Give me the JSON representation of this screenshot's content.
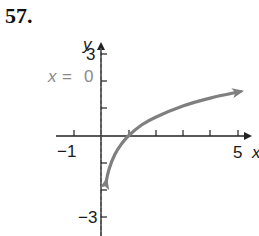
{
  "problem": {
    "number": "57."
  },
  "asymptote_label": {
    "var": "x",
    "eq": "=",
    "value": "0"
  },
  "axes": {
    "x_label": "x",
    "y_label": "y",
    "x_tick_labels": {
      "neg1": "−1",
      "five": "5"
    },
    "y_tick_labels": {
      "three": "3",
      "neg3": "−3"
    }
  },
  "colors": {
    "curve": "#7f7f7f",
    "axis": "#222222",
    "asymptote": "#555555",
    "label_gray": "#8a8a8a"
  },
  "chart_data": {
    "type": "line",
    "title": "",
    "xlabel": "x",
    "ylabel": "y",
    "xlim": [
      -1.2,
      5.3
    ],
    "ylim": [
      -3.3,
      3.5
    ],
    "x_ticks": [
      -1,
      0,
      1,
      2,
      3,
      4,
      5
    ],
    "y_ticks": [
      -3,
      -2,
      -1,
      0,
      1,
      2,
      3
    ],
    "labeled_x_ticks": [
      -1,
      5
    ],
    "labeled_y_ticks": [
      3,
      -3
    ],
    "grid": false,
    "series": [
      {
        "name": "y = ln x",
        "x": [
          0.19,
          0.3,
          0.5,
          0.75,
          1,
          1.5,
          2,
          3,
          4,
          5.1
        ],
        "y": [
          -1.66,
          -1.2,
          -0.69,
          -0.29,
          0,
          0.41,
          0.69,
          1.1,
          1.39,
          1.63
        ],
        "arrows": "both"
      }
    ],
    "annotations": [
      {
        "type": "vertical_asymptote",
        "x": 0,
        "style": "dashed",
        "label": "x = 0"
      }
    ]
  }
}
